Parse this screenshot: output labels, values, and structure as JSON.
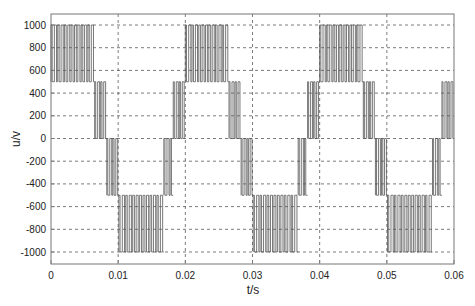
{
  "chart_data": {
    "type": "line",
    "title": "",
    "xlabel": "t/s",
    "ylabel": "u/v",
    "xlim": [
      0,
      0.06
    ],
    "ylim": [
      -1100,
      1100
    ],
    "xticks": [
      0,
      0.01,
      0.02,
      0.03,
      0.04,
      0.05,
      0.06
    ],
    "xtick_labels": [
      "0",
      "0.01",
      "0.02",
      "0.03",
      "0.04",
      "0.05",
      "0.06"
    ],
    "yticks": [
      1000,
      800,
      600,
      400,
      200,
      0,
      -200,
      -400,
      -600,
      -800,
      -1000
    ],
    "ytick_labels": [
      "1000",
      "800",
      "600",
      "400",
      "200",
      "0",
      "-200",
      "-400",
      "-600",
      "-800",
      "-1000"
    ],
    "grid": true,
    "grid_style": "dashed",
    "legend": null,
    "series": [
      {
        "name": "multilevel PWM output voltage",
        "description": "5-level PWM waveform with levels -1000, -500, 0, 500, 1000 V; period 0.02 s",
        "levels": [
          -1000,
          -500,
          0,
          500,
          1000
        ],
        "period": 0.02,
        "segments": [
          {
            "t_start": 0.0,
            "t_end": 0.0065,
            "low": 500,
            "high": 1000
          },
          {
            "t_start": 0.0065,
            "t_end": 0.0083,
            "low": 0,
            "high": 500
          },
          {
            "t_start": 0.0083,
            "t_end": 0.0101,
            "low": -500,
            "high": 0
          },
          {
            "t_start": 0.0101,
            "t_end": 0.0168,
            "low": -1000,
            "high": -500
          },
          {
            "t_start": 0.0168,
            "t_end": 0.0182,
            "low": -500,
            "high": 0
          },
          {
            "t_start": 0.0182,
            "t_end": 0.02,
            "low": 0,
            "high": 500
          },
          {
            "t_start": 0.02,
            "t_end": 0.0265,
            "low": 500,
            "high": 1000
          },
          {
            "t_start": 0.0265,
            "t_end": 0.0283,
            "low": 0,
            "high": 500
          },
          {
            "t_start": 0.0283,
            "t_end": 0.0301,
            "low": -500,
            "high": 0
          },
          {
            "t_start": 0.0301,
            "t_end": 0.0368,
            "low": -1000,
            "high": -500
          },
          {
            "t_start": 0.0368,
            "t_end": 0.0382,
            "low": -500,
            "high": 0
          },
          {
            "t_start": 0.0382,
            "t_end": 0.04,
            "low": 0,
            "high": 500
          },
          {
            "t_start": 0.04,
            "t_end": 0.0465,
            "low": 500,
            "high": 1000
          },
          {
            "t_start": 0.0465,
            "t_end": 0.0483,
            "low": 0,
            "high": 500
          },
          {
            "t_start": 0.0483,
            "t_end": 0.0501,
            "low": -500,
            "high": 0
          },
          {
            "t_start": 0.0501,
            "t_end": 0.0568,
            "low": -1000,
            "high": -500
          },
          {
            "t_start": 0.0568,
            "t_end": 0.0582,
            "low": -500,
            "high": 0
          },
          {
            "t_start": 0.0582,
            "t_end": 0.06,
            "low": 0,
            "high": 500
          }
        ],
        "switching_period": 0.0005,
        "color": "#555555"
      }
    ]
  },
  "colors": {
    "axes": "#777777",
    "grid": "#444444",
    "waveform": "#555555",
    "background": "#ffffff"
  }
}
